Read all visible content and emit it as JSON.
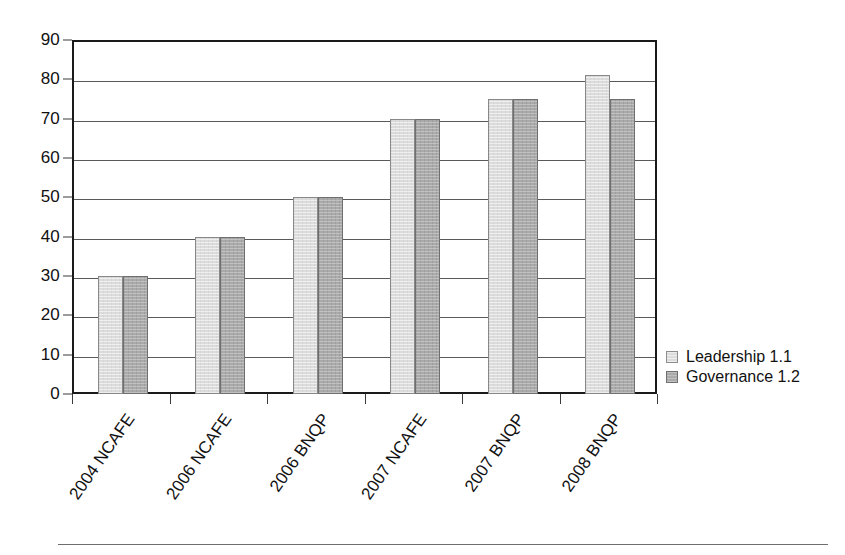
{
  "chart_data": {
    "type": "bar",
    "title": "",
    "subtitle": "",
    "xlabel": "",
    "ylabel": "",
    "categories": [
      "2004 NCAFE",
      "2006 NCAFE",
      "2006 BNQP",
      "2007 NCAFE",
      "2007 BNQP",
      "2008 BNQP"
    ],
    "series": [
      {
        "name": "Leadership 1.1",
        "color": "#dcdcdc",
        "values": [
          30,
          40,
          50,
          70,
          75,
          81
        ]
      },
      {
        "name": "Governance 1.2",
        "color": "#aaaaaa",
        "values": [
          30,
          40,
          50,
          70,
          75,
          75
        ]
      }
    ],
    "ylim": [
      0,
      90
    ],
    "ytick_step": 10,
    "yticks": [
      0,
      10,
      20,
      30,
      40,
      50,
      60,
      70,
      80,
      90
    ],
    "ytick_labels": [
      "0",
      "10",
      "20",
      "30",
      "40",
      "50",
      "60",
      "70",
      "80",
      "90"
    ],
    "grid": true,
    "grid_axis": "y",
    "legend_position": "right",
    "xtick_label_rotation": -55,
    "frame": true,
    "frame_color": "#1a1a1a",
    "gridline_color": "#5a5a5a",
    "background_color": "#ffffff"
  },
  "legend": {
    "entries": [
      {
        "label": "Leadership 1.1",
        "swatch": "legend-swatch-leadership"
      },
      {
        "label": "Governance 1.2",
        "swatch": "legend-swatch-governance"
      }
    ]
  }
}
